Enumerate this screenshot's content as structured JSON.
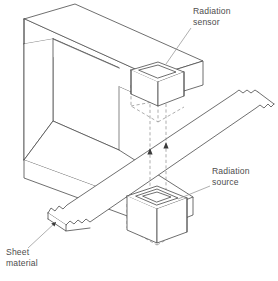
{
  "diagram": {
    "type": "engineering-line-diagram",
    "background_color": "#ffffff",
    "line_color": "#4a4a4a",
    "hidden_line_color": "#8a8a8a",
    "text_color": "#4d4d4d"
  },
  "labels": {
    "sensor": {
      "line1": "Radiation",
      "line2": "sensor",
      "anchor_x": 193,
      "anchor_y": 10
    },
    "source": {
      "line1": "Radiation",
      "line2": "source",
      "anchor_x": 212,
      "anchor_y": 170
    },
    "sheet": {
      "line1": "Sheet",
      "line2": "material",
      "anchor_x": 6,
      "anchor_y": 250
    }
  },
  "components": [
    {
      "name": "c-frame",
      "description": "C-shaped box-section gauge frame"
    },
    {
      "name": "radiation-sensor-box",
      "description": "Open-top detector housing on upper arm"
    },
    {
      "name": "radiation-source-box",
      "description": "Open-top source housing on lower arm"
    },
    {
      "name": "sheet-material",
      "description": "Flat strip passing through the frame throat, torn ends"
    },
    {
      "name": "radiation-beam",
      "description": "Two dashed vertical rays with upward arrowheads"
    }
  ],
  "beam": {
    "direction": "upward",
    "ray_count": 2,
    "style": "dashed"
  }
}
